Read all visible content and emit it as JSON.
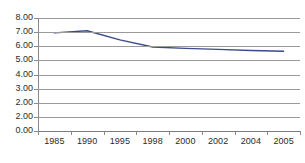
{
  "chart_data": {
    "type": "line",
    "title": "",
    "subtitle": "",
    "xlabel": "",
    "ylabel": "",
    "categories": [
      "1985",
      "1990",
      "1995",
      "1998",
      "2000",
      "2002",
      "2004",
      "2005"
    ],
    "series": [
      {
        "name": "series-1",
        "values": [
          6.95,
          7.1,
          6.45,
          5.95,
          5.85,
          5.78,
          5.7,
          5.65
        ],
        "color": "#3b4a8c"
      }
    ],
    "ylim": [
      0,
      8
    ],
    "y_ticks": [
      8,
      7,
      6,
      5,
      4,
      3,
      2,
      1,
      0
    ],
    "y_tick_labels": [
      "8.00",
      "7.00",
      "6.00",
      "5.00",
      "4.00",
      "3.00",
      "2.00",
      "2.00",
      "0.00"
    ],
    "grid": true,
    "grid_axis": "y",
    "legend": false,
    "legend_position": "none",
    "annotations": [],
    "colors": {
      "line": "#3b4a8c",
      "grid": "#9a9a9a",
      "axis": "#8a8a8a",
      "text": "#2b2b2b",
      "background": "#ffffff"
    }
  }
}
